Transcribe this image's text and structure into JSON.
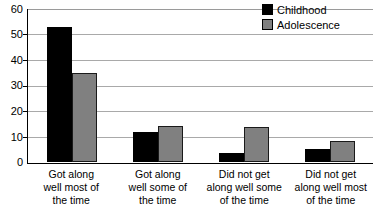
{
  "chart_data": {
    "type": "bar",
    "title": "",
    "xlabel": "",
    "ylabel": "",
    "ylim": [
      0,
      60
    ],
    "yticks": [
      60,
      50,
      40,
      30,
      20,
      10,
      0
    ],
    "grid": true,
    "legend_position": "top-right",
    "categories": [
      "Got along well most of the time",
      "Got along well some of the time",
      "Did not get along well some of the time",
      "Did not get along well most of the time"
    ],
    "category_lines": [
      [
        "Got along",
        "well most of",
        "the time"
      ],
      [
        "Got along",
        "well some of",
        "the time"
      ],
      [
        "Did not get",
        "along well some",
        "of the time"
      ],
      [
        "Did not get",
        "along well most",
        "of the time"
      ]
    ],
    "series": [
      {
        "name": "Childhood",
        "color": "#000000",
        "values": [
          52.5,
          11.5,
          3.5,
          5
        ]
      },
      {
        "name": "Adolescence",
        "color": "#808080",
        "values": [
          34.5,
          14,
          13.5,
          8
        ]
      }
    ]
  },
  "legend": {
    "items": [
      {
        "label": "Childhood",
        "color": "#000000"
      },
      {
        "label": "Adolescence",
        "color": "#808080"
      }
    ]
  },
  "axis": {
    "y_tick_labels": [
      "60",
      "50",
      "40",
      "30",
      "20",
      "10",
      "0"
    ]
  }
}
